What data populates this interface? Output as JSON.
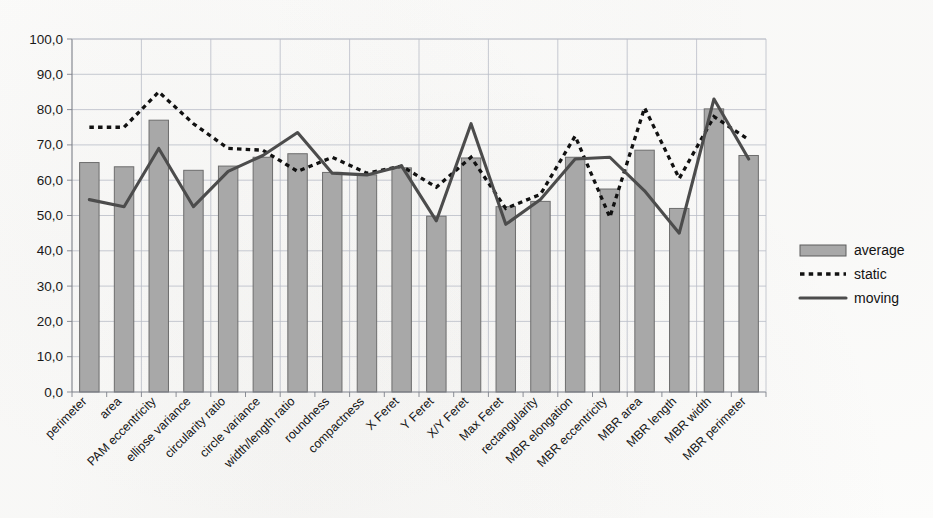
{
  "chart_data": {
    "type": "bar",
    "title": "",
    "xlabel": "",
    "ylabel": "",
    "ylim": [
      0,
      100
    ],
    "ytick_labels": [
      "100,0",
      "90,0",
      "80,0",
      "70,0",
      "60,0",
      "50,0",
      "40,0",
      "30,0",
      "20,0",
      "10,0",
      "0,0"
    ],
    "ytick_values": [
      100,
      90,
      80,
      70,
      60,
      50,
      40,
      30,
      20,
      10,
      0
    ],
    "grid": true,
    "legend_position": "right",
    "decimal_separator": ",",
    "categories": [
      "perimeter",
      "area",
      "PAM eccentricity",
      "ellipse variance",
      "circularity ratio",
      "circle variance",
      "width/length ratio",
      "roundness",
      "compactness",
      "X Feret",
      "Y Feret",
      "X/Y Feret",
      "Max Feret",
      "rectangularity",
      "MBR elongation",
      "MBR eccentricity",
      "MBR area",
      "MBR length",
      "MBR width",
      "MBR perimeter"
    ],
    "series": [
      {
        "name": "average",
        "kind": "bar",
        "color": "#a8a8a8",
        "values": [
          65.0,
          63.8,
          77.0,
          62.8,
          64.0,
          66.5,
          67.5,
          62.2,
          61.5,
          63.5,
          49.8,
          66.3,
          52.5,
          54.0,
          66.5,
          57.5,
          68.5,
          52.0,
          80.2,
          67.0
        ]
      },
      {
        "name": "static",
        "kind": "line",
        "style": "dotted",
        "color": "#111111",
        "values": [
          75.0,
          75.0,
          85.0,
          76.0,
          69.0,
          68.5,
          62.5,
          66.5,
          62.0,
          64.0,
          58.0,
          66.5,
          52.0,
          56.0,
          72.5,
          49.5,
          80.5,
          60.5,
          78.0,
          71.5
        ]
      },
      {
        "name": "moving",
        "kind": "line",
        "style": "solid",
        "color": "#4c4c4c",
        "values": [
          54.5,
          52.5,
          69.0,
          52.5,
          62.5,
          67.0,
          73.5,
          62.0,
          61.5,
          64.0,
          48.5,
          76.0,
          47.5,
          54.5,
          66.0,
          66.5,
          57.0,
          45.0,
          83.0,
          66.0
        ]
      }
    ]
  },
  "legend": {
    "items": [
      {
        "label": "average",
        "type": "bar-swatch"
      },
      {
        "label": "static",
        "type": "dotted-line"
      },
      {
        "label": "moving",
        "type": "solid-line"
      }
    ]
  }
}
